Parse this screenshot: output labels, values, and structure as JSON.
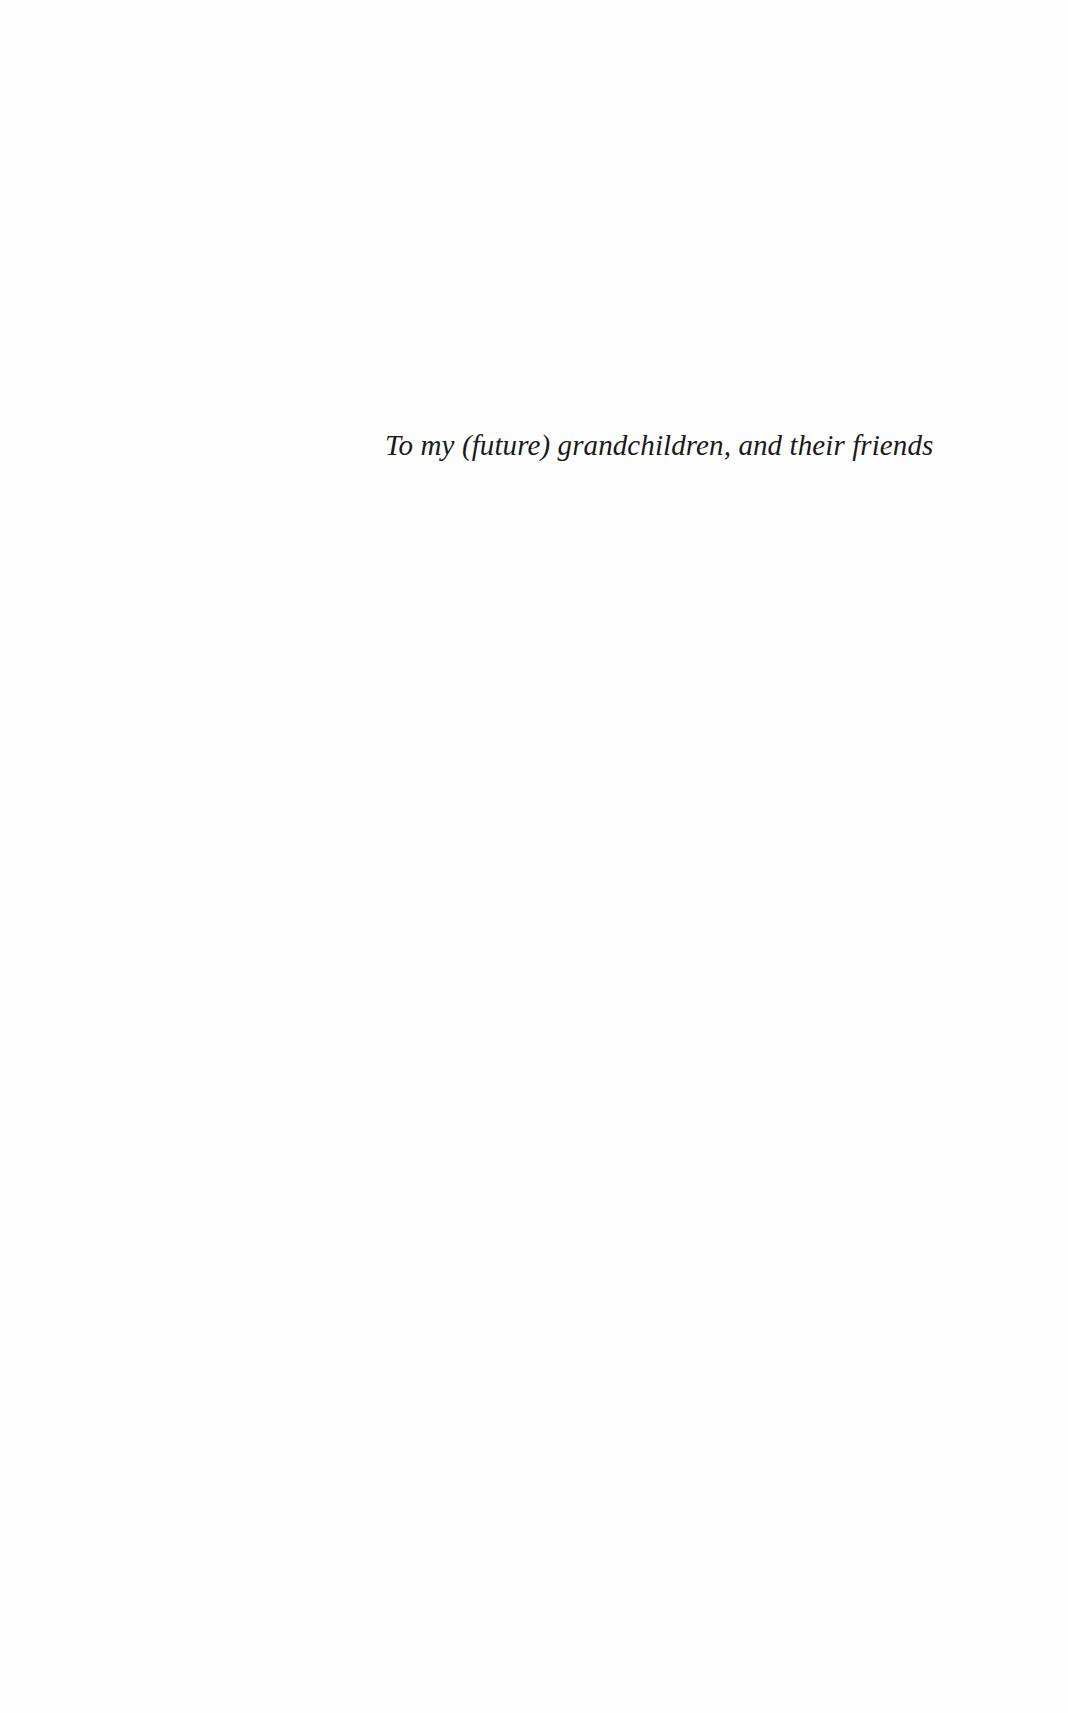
{
  "page": {
    "type": "dedication",
    "dedication_text": "To my (future) grandchildren, and their friends"
  }
}
